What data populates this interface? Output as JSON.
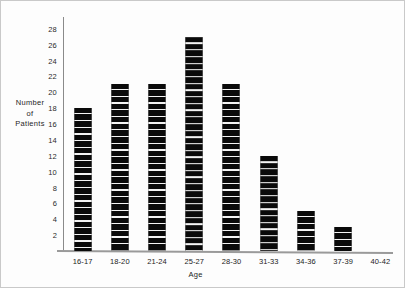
{
  "chart_data": {
    "type": "bar",
    "title": "",
    "subtitle": "",
    "xlabel": "Age",
    "ylabel": "Number of Patients",
    "ylabel_lines": [
      "Number",
      "of",
      "Patients"
    ],
    "categories": [
      "16-17",
      "18-20",
      "21-24",
      "25-27",
      "28-30",
      "31-33",
      "34-36",
      "37-39",
      "40-42"
    ],
    "values": [
      18,
      21,
      21,
      27,
      21,
      12,
      5,
      3,
      0
    ],
    "ylim": [
      0,
      29.5
    ],
    "ytick_labels": [
      "2",
      "4",
      "6",
      "8",
      "10",
      "12",
      "14",
      "16",
      "18",
      "20",
      "22",
      "24",
      "26",
      "28"
    ],
    "ytick_values": [
      2,
      4,
      6,
      8,
      10,
      12,
      14,
      16,
      18,
      20,
      22,
      24,
      26,
      28
    ],
    "ytick_step": 2,
    "grid": false,
    "legend": false,
    "legend_position": "none",
    "bar_color": "#0a0a0a",
    "bar_pattern": "segmented-blocks",
    "axis_color": "#8a8a8a",
    "background_color": "#fdfdfd"
  }
}
